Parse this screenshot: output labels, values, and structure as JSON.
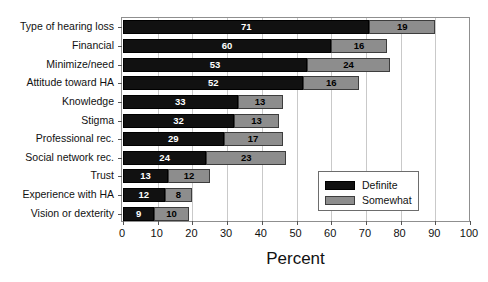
{
  "chart_data": {
    "type": "bar",
    "orientation": "horizontal",
    "stacked": true,
    "title": "",
    "xlabel": "Percent",
    "ylabel": "",
    "xlim": [
      0,
      100
    ],
    "xticks": [
      0,
      10,
      20,
      30,
      40,
      50,
      60,
      70,
      80,
      90,
      100
    ],
    "grid": true,
    "legend_position": "inside-lower-right",
    "categories": [
      "Type of hearing loss",
      "Financial",
      "Minimize/need",
      "Attitude toward HA",
      "Knowledge",
      "Stigma",
      "Professional rec.",
      "Social network rec.",
      "Trust",
      "Experience with HA",
      "Vision or dexterity"
    ],
    "series": [
      {
        "name": "Definite",
        "color": "#111111",
        "values": [
          71,
          60,
          53,
          52,
          33,
          32,
          29,
          24,
          13,
          12,
          9
        ]
      },
      {
        "name": "Somewhat",
        "color": "#8d8d8d",
        "values": [
          19,
          16,
          24,
          16,
          13,
          13,
          17,
          23,
          12,
          8,
          10
        ]
      }
    ]
  },
  "axis": {
    "x_title": "Percent",
    "tick_labels": [
      "0",
      "10",
      "20",
      "30",
      "40",
      "50",
      "60",
      "70",
      "80",
      "90",
      "100"
    ]
  },
  "legend": {
    "items": [
      {
        "label": "Definite"
      },
      {
        "label": "Somewhat"
      }
    ]
  }
}
